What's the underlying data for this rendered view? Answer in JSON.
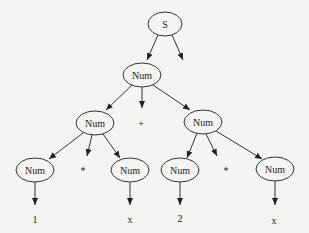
{
  "diagram": {
    "type": "parse-tree",
    "nodes": [
      {
        "id": "s",
        "label": "S",
        "kind": "ellipse",
        "cx": 165,
        "cy": 24,
        "rx": 17,
        "ry": 12
      },
      {
        "id": "num_root",
        "label": "Num",
        "kind": "ellipse",
        "cx": 142,
        "cy": 75,
        "rx": 19,
        "ry": 12
      },
      {
        "id": "num_left",
        "label": "Num",
        "kind": "ellipse",
        "cx": 95,
        "cy": 123,
        "rx": 19,
        "ry": 12
      },
      {
        "id": "plus",
        "label": "+",
        "kind": "text",
        "cx": 141,
        "cy": 123
      },
      {
        "id": "num_right",
        "label": "Num",
        "kind": "ellipse",
        "cx": 203,
        "cy": 122,
        "rx": 19,
        "ry": 12
      },
      {
        "id": "num_ll",
        "label": "Num",
        "kind": "ellipse",
        "cx": 35,
        "cy": 170,
        "rx": 19,
        "ry": 12
      },
      {
        "id": "star_left",
        "label": "*",
        "kind": "text",
        "cx": 83,
        "cy": 170
      },
      {
        "id": "num_lr",
        "label": "Num",
        "kind": "ellipse",
        "cx": 130,
        "cy": 170,
        "rx": 19,
        "ry": 12
      },
      {
        "id": "num_rl",
        "label": "Num",
        "kind": "ellipse",
        "cx": 180,
        "cy": 170,
        "rx": 19,
        "ry": 12
      },
      {
        "id": "star_right",
        "label": "*",
        "kind": "text",
        "cx": 226,
        "cy": 170
      },
      {
        "id": "num_rr",
        "label": "Num",
        "kind": "ellipse",
        "cx": 275,
        "cy": 169,
        "rx": 19,
        "ry": 12
      },
      {
        "id": "one",
        "label": "1",
        "kind": "text",
        "cx": 35,
        "cy": 219
      },
      {
        "id": "x_left",
        "label": "x",
        "kind": "text",
        "cx": 130,
        "cy": 219
      },
      {
        "id": "two",
        "label": "2",
        "kind": "text",
        "cx": 180,
        "cy": 218
      },
      {
        "id": "x_right",
        "label": "x",
        "kind": "text",
        "cx": 274,
        "cy": 220
      }
    ],
    "edges": [
      {
        "x1": 158,
        "y1": 35,
        "x2": 147,
        "y2": 60
      },
      {
        "x1": 172,
        "y1": 35,
        "x2": 183,
        "y2": 60
      },
      {
        "x1": 132,
        "y1": 85,
        "x2": 106,
        "y2": 110
      },
      {
        "x1": 142,
        "y1": 87,
        "x2": 142,
        "y2": 108
      },
      {
        "x1": 153,
        "y1": 85,
        "x2": 190,
        "y2": 110
      },
      {
        "x1": 83,
        "y1": 133,
        "x2": 49,
        "y2": 159
      },
      {
        "x1": 92,
        "y1": 135,
        "x2": 87,
        "y2": 156
      },
      {
        "x1": 103,
        "y1": 134,
        "x2": 120,
        "y2": 158
      },
      {
        "x1": 197,
        "y1": 133,
        "x2": 187,
        "y2": 158
      },
      {
        "x1": 206,
        "y1": 134,
        "x2": 217,
        "y2": 156
      },
      {
        "x1": 216,
        "y1": 131,
        "x2": 262,
        "y2": 159
      },
      {
        "x1": 35,
        "y1": 182,
        "x2": 35,
        "y2": 205
      },
      {
        "x1": 130,
        "y1": 182,
        "x2": 130,
        "y2": 205
      },
      {
        "x1": 180,
        "y1": 182,
        "x2": 180,
        "y2": 205
      },
      {
        "x1": 275,
        "y1": 181,
        "x2": 275,
        "y2": 205
      }
    ]
  }
}
